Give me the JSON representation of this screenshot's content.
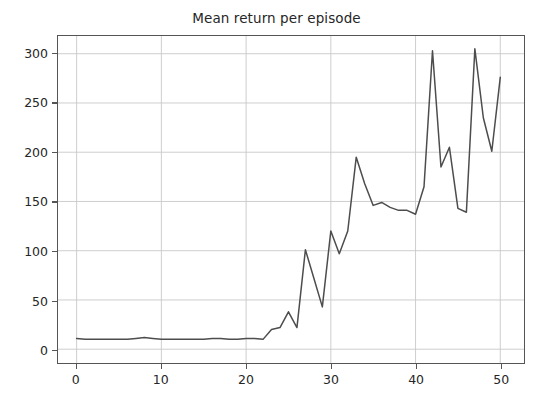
{
  "chart_data": {
    "type": "line",
    "title": "Mean return per episode",
    "xlabel": "",
    "ylabel": "",
    "xlim": [
      -2.2,
      52.8
    ],
    "ylim": [
      -14,
      318
    ],
    "grid": true,
    "legend": null,
    "grid_color": "#c8c8c8",
    "line_color": "#4d4d4d",
    "background_color": "#ffffff",
    "frame_color": "#555555",
    "xticks": [
      0,
      10,
      20,
      30,
      40,
      50
    ],
    "xtick_labels": [
      "0",
      "10",
      "20",
      "30",
      "40",
      "50"
    ],
    "yticks": [
      0,
      50,
      100,
      150,
      200,
      250,
      300
    ],
    "ytick_labels": [
      "0",
      "50",
      "100",
      "150",
      "200",
      "250",
      "300"
    ],
    "series": [
      {
        "name": "mean_return",
        "x": [
          0,
          1,
          2,
          3,
          4,
          5,
          6,
          7,
          8,
          9,
          10,
          11,
          12,
          13,
          14,
          15,
          16,
          17,
          18,
          19,
          20,
          21,
          22,
          23,
          24,
          25,
          26,
          27,
          28,
          29,
          30,
          31,
          32,
          33,
          34,
          35,
          36,
          37,
          38,
          39,
          40,
          41,
          42,
          43,
          44,
          45,
          46,
          47,
          48,
          49,
          50
        ],
        "values": [
          11,
          10,
          10,
          10,
          10,
          10,
          10,
          11,
          12,
          11,
          10,
          10,
          10,
          10,
          10,
          10,
          11,
          11,
          10,
          10,
          11,
          11,
          10,
          20,
          22,
          38,
          22,
          101,
          72,
          43,
          120,
          97,
          120,
          195,
          168,
          146,
          149,
          144,
          141,
          141,
          137,
          165,
          303,
          185,
          205,
          143,
          139,
          305,
          235,
          201,
          276
        ]
      }
    ]
  },
  "axis": {
    "tick_label_color": "#262626"
  }
}
